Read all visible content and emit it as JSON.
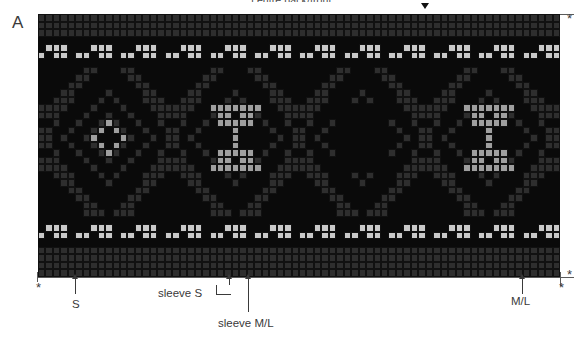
{
  "panel": {
    "letter": "A"
  },
  "header": {
    "center_label": "centre back/front",
    "center_marker_icon": "down-triangle-marker"
  },
  "markers": {
    "asterisk_glyph": "*",
    "top_right_asterisk": "*",
    "bottom_left_asterisk": "*",
    "bottom_right_asterisk_outer": "*",
    "bottom_right_asterisk_inner": "*"
  },
  "annotations": [
    {
      "id": "s",
      "label": "S",
      "arrow_icon": "up-arrow",
      "col": 5
    },
    {
      "id": "sleeve-s",
      "label": "sleeve S",
      "arrow_icon": "up-arrow-short",
      "col": 26
    },
    {
      "id": "sleeve-ml",
      "label": "sleeve M/L",
      "arrow_icon": "up-arrow-long",
      "col": 28
    },
    {
      "id": "ml",
      "label": "M/L",
      "arrow_icon": "up-arrow",
      "col": 65
    }
  ],
  "colors": {
    "background": "#0a0a0a",
    "dark": "#0a0a0a",
    "mid": "#2e2e2e",
    "light": "#c9c9c9",
    "accent": "#9f9f9f",
    "grid_line": "#111111",
    "text": "#3a3a3a",
    "rule": "#5a5a5a",
    "page": "#ffffff"
  },
  "chart_data": {
    "type": "heatmap",
    "xlabel": "stitches",
    "ylabel": "rounds",
    "columns": 70,
    "rows": 35,
    "grid": true,
    "legend_position": "none",
    "palette_keys": [
      "dark",
      "mid",
      "light",
      "accent"
    ],
    "cell_px": 7.457,
    "bands": [
      {
        "name": "top-seed-band",
        "rows": [
          0,
          1,
          2
        ],
        "kind": "checker-mid"
      },
      {
        "name": "top-spacer",
        "rows": [
          3
        ],
        "kind": "dark"
      },
      {
        "name": "top-peerie-band",
        "rows": [
          4,
          5
        ],
        "kind": "peerie-light"
      },
      {
        "name": "upper-spacer",
        "rows": [
          6
        ],
        "kind": "dark"
      },
      {
        "name": "main-motif-band",
        "rows": [
          7,
          8,
          9,
          10,
          11,
          12,
          13,
          14,
          15,
          16,
          17,
          18,
          19,
          20,
          21,
          22,
          23,
          24,
          25,
          26
        ],
        "kind": "ogee-motifs"
      },
      {
        "name": "lower-spacer",
        "rows": [
          27
        ],
        "kind": "dark"
      },
      {
        "name": "bottom-peerie-band",
        "rows": [
          28,
          29
        ],
        "kind": "peerie-light"
      },
      {
        "name": "bottom-spacer",
        "rows": [
          30
        ],
        "kind": "dark"
      },
      {
        "name": "bottom-seed-band",
        "rows": [
          31,
          32,
          33,
          34
        ],
        "kind": "checker-mid"
      }
    ],
    "motif_repeat_width": 17,
    "motif_centers": [
      9,
      26,
      43,
      60
    ],
    "motif_variants": [
      "diamond-star-accent",
      "small-cross-accent",
      "solid-block",
      "small-cross-accent"
    ]
  }
}
